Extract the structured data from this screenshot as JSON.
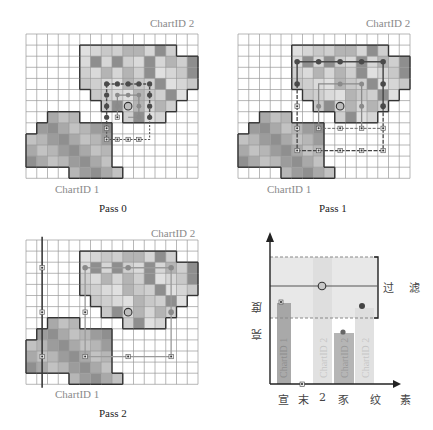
{
  "panels": [
    {
      "id": "pass0",
      "title": "Pass 0",
      "chart_top_label": "ChartID 2",
      "chart_bottom_label": "ChartID 1"
    },
    {
      "id": "pass1",
      "title": "Pass 1",
      "chart_top_label": "ChartID 2",
      "chart_bottom_label": "ChartID 1"
    },
    {
      "id": "pass2",
      "title": "Pass 2",
      "chart_top_label": "ChartID 2",
      "chart_bottom_label": "ChartID 1"
    }
  ],
  "plot": {
    "y_axis_label": "亮 度",
    "x_axis_label": "纹 素",
    "x_tick_labels": [
      "宣",
      "末",
      "2",
      "豕"
    ],
    "filter_label": "过 滤",
    "bars": [
      {
        "label": "ChartID 1",
        "shade": "#9a9a9a"
      },
      {
        "label": "ChartID 2",
        "shade": "#dcdcdc"
      },
      {
        "label": "ChartID 2",
        "shade": "#a8a8a8"
      },
      {
        "label": "ChartID 2",
        "shade": "#dcdcdc"
      }
    ]
  },
  "colors": {
    "grid_line": "#9a9a9a",
    "outline": "#333333",
    "dark_marker": "#4a4a4a",
    "mid_marker": "#8a8a8a",
    "filter_band": "#e8e8e8"
  }
}
